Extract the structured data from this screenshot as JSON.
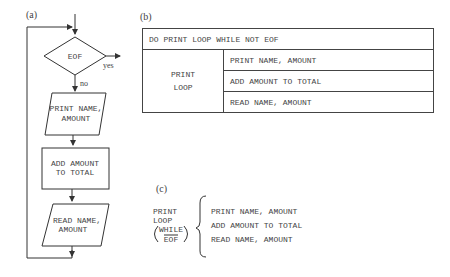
{
  "panels": {
    "a": {
      "label": "(a)",
      "decision": {
        "text": "EOF",
        "yes_label": "yes",
        "no_label": "no"
      },
      "steps": [
        {
          "type": "io",
          "lines": [
            "PRINT NAME,",
            "AMOUNT"
          ]
        },
        {
          "type": "process",
          "lines": [
            "ADD AMOUNT",
            "TO TOTAL"
          ]
        },
        {
          "type": "io",
          "lines": [
            "READ NAME,",
            "AMOUNT"
          ]
        }
      ]
    },
    "b": {
      "label": "(b)",
      "header": "DO PRINT LOOP WHILE NOT EOF",
      "block_name": [
        "PRINT",
        "LOOP"
      ],
      "steps": [
        "PRINT NAME, AMOUNT",
        "ADD AMOUNT TO TOTAL",
        "READ NAME, AMOUNT"
      ]
    },
    "c": {
      "label": "(c)",
      "block_name": [
        "PRINT",
        "LOOP"
      ],
      "condition_top": "WHILE",
      "condition_bottom": "EOF",
      "steps": [
        "PRINT NAME, AMOUNT",
        "ADD AMOUNT TO TOTAL",
        "READ NAME, AMOUNT"
      ]
    }
  }
}
